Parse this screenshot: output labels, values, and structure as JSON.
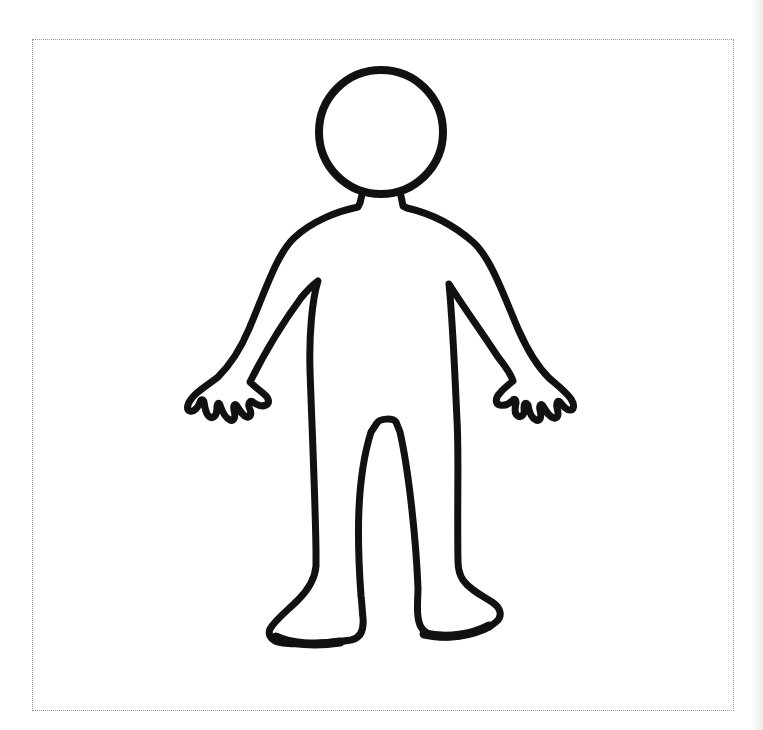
{
  "page": {
    "background_color": "#ffffff",
    "border": {
      "style": "dotted",
      "color": "#9a9a9a"
    }
  },
  "figure": {
    "name": "human-body-outline",
    "stroke_color": "#111111",
    "fill_color": "#ffffff"
  }
}
